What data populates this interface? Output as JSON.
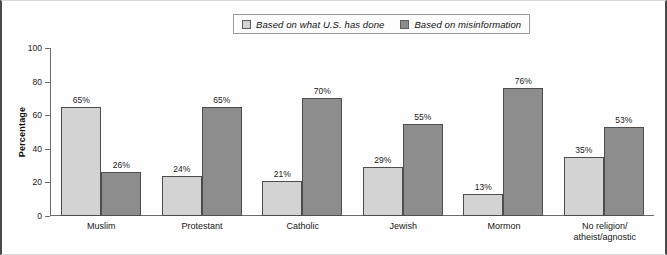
{
  "chart_data": {
    "type": "bar",
    "title": "",
    "xlabel": "",
    "ylabel": "Percentage",
    "ylim": [
      0,
      100
    ],
    "yticks": [
      0,
      20,
      40,
      60,
      80,
      100
    ],
    "grid": false,
    "legend_position": "top-center",
    "categories": [
      "Muslim",
      "Protestant",
      "Catholic",
      "Jewish",
      "Mormon",
      "No religion/ atheist/agnostic"
    ],
    "category_lines": [
      [
        "Muslim"
      ],
      [
        "Protestant"
      ],
      [
        "Catholic"
      ],
      [
        "Jewish"
      ],
      [
        "Mormon"
      ],
      [
        "No religion/",
        "atheist/agnostic"
      ]
    ],
    "series": [
      {
        "name": "Based on what U.S. has done",
        "color": "#d3d3d3",
        "values": [
          65,
          24,
          21,
          29,
          13,
          35
        ],
        "labels": [
          "65%",
          "24%",
          "21%",
          "29%",
          "13%",
          "35%"
        ]
      },
      {
        "name": "Based on misinformation",
        "color": "#8d8d8d",
        "values": [
          26,
          65,
          70,
          55,
          76,
          53
        ],
        "labels": [
          "26%",
          "65%",
          "70%",
          "55%",
          "76%",
          "53%"
        ]
      }
    ]
  },
  "legend": {
    "entries": [
      {
        "label": "Based on what U.S. has done",
        "color": "#d3d3d3"
      },
      {
        "label": "Based on misinformation",
        "color": "#8d8d8d"
      }
    ]
  },
  "axis": {
    "y_title": "Percentage",
    "y_ticks": [
      "100",
      "80",
      "60",
      "40",
      "20",
      "0"
    ]
  }
}
